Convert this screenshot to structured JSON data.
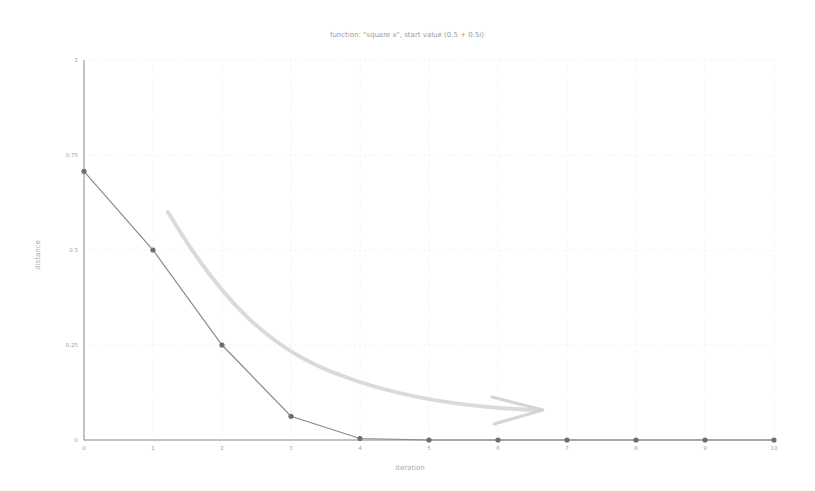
{
  "chart_data": {
    "type": "line",
    "title": "function: \"square x\", start value (0.5 + 0.5i)",
    "xlabel": "iteration",
    "ylabel": "distance",
    "x": [
      0,
      1,
      2,
      3,
      4,
      5,
      6,
      7,
      8,
      9,
      10
    ],
    "series": [
      {
        "name": "distance",
        "values": [
          0.707,
          0.5,
          0.25,
          0.0625,
          0.0039,
          0.0,
          0.0,
          0.0,
          0.0,
          0.0,
          0.0
        ],
        "color": "#7a7a7a"
      }
    ],
    "x_ticks": [
      "0",
      "1",
      "2",
      "3",
      "4",
      "5",
      "6",
      "7",
      "8",
      "9",
      "10"
    ],
    "y_ticks": [
      "0",
      "0.25",
      "0.5",
      "0.75",
      "1"
    ],
    "xlim": [
      0,
      10
    ],
    "ylim": [
      0,
      1
    ],
    "grid": true,
    "legend": "none",
    "annotations": [
      {
        "type": "arrow",
        "description": "curved gray arrow indicating convergence toward 0",
        "color": "#c8c8c8"
      }
    ]
  },
  "colors": {
    "axis": "#8a8a8a",
    "line": "#8a8a8a",
    "marker": "#6e6e6e",
    "grid": "#f0f0f0",
    "arrow": "#cfcfcf"
  }
}
